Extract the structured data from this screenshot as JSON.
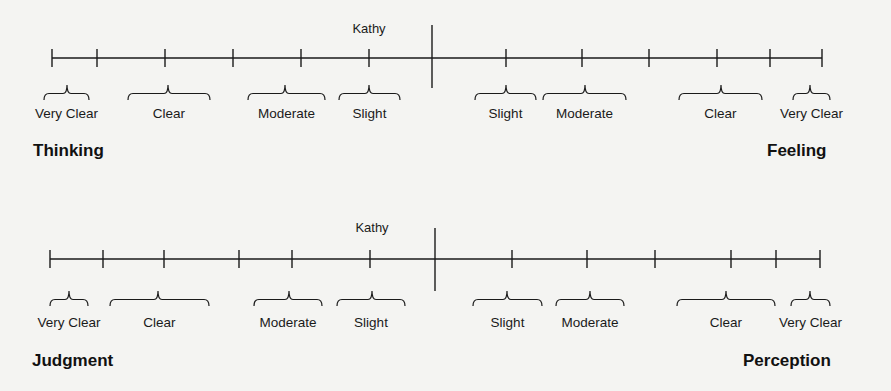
{
  "scales": [
    {
      "id": "thinking-feeling",
      "left_pole": "Thinking",
      "right_pole": "Feeling",
      "marker_label": "Kathy",
      "line_y": 58,
      "x_start": 52,
      "x_end": 822,
      "center_x": 432,
      "center_top": 25,
      "center_bottom": 88,
      "marker_x": 369,
      "marker_y": 33,
      "ticks": [
        52,
        97,
        165,
        233,
        301,
        369,
        506,
        582,
        649,
        717,
        770,
        822
      ],
      "brace_top": 85,
      "brace_bottom": 100,
      "label_y": 118,
      "pole_y": 156,
      "left_pole_x": 33,
      "right_pole_x": 767,
      "categories": [
        {
          "label": "Very Clear",
          "x1": 44,
          "x2": 89,
          "peak": 67
        },
        {
          "label": "Clear",
          "x1": 128,
          "x2": 210,
          "peak": 168
        },
        {
          "label": "Moderate",
          "x1": 248,
          "x2": 325,
          "peak": 285
        },
        {
          "label": "Slight",
          "x1": 339,
          "x2": 400,
          "peak": 369
        },
        {
          "label": "Slight",
          "x1": 475,
          "x2": 536,
          "peak": 506
        },
        {
          "label": "Moderate",
          "x1": 543,
          "x2": 626,
          "peak": 585
        },
        {
          "label": "Clear",
          "x1": 679,
          "x2": 762,
          "peak": 721
        },
        {
          "label": "Very Clear",
          "x1": 793,
          "x2": 830,
          "peak": 810
        }
      ]
    },
    {
      "id": "judgment-perception",
      "left_pole": "Judgment",
      "right_pole": "Perception",
      "marker_label": "Kathy",
      "line_y": 259,
      "x_start": 50,
      "x_end": 820,
      "center_x": 435,
      "center_top": 228,
      "center_bottom": 291,
      "marker_x": 372,
      "marker_y": 232,
      "ticks": [
        50,
        103,
        164,
        239,
        292,
        370,
        512,
        587,
        655,
        731,
        776,
        820
      ],
      "brace_top": 291,
      "brace_bottom": 306,
      "label_y": 327,
      "pole_y": 366,
      "left_pole_x": 32,
      "right_pole_x": 743,
      "categories": [
        {
          "label": "Very Clear",
          "x1": 50,
          "x2": 88,
          "peak": 69
        },
        {
          "label": "Clear",
          "x1": 110,
          "x2": 209,
          "peak": 158
        },
        {
          "label": "Moderate",
          "x1": 254,
          "x2": 322,
          "peak": 289
        },
        {
          "label": "Slight",
          "x1": 337,
          "x2": 405,
          "peak": 372
        },
        {
          "label": "Slight",
          "x1": 473,
          "x2": 542,
          "peak": 507
        },
        {
          "label": "Moderate",
          "x1": 556,
          "x2": 624,
          "peak": 590
        },
        {
          "label": "Clear",
          "x1": 677,
          "x2": 775,
          "peak": 726
        },
        {
          "label": "Very Clear",
          "x1": 791,
          "x2": 830,
          "peak": 810
        }
      ]
    }
  ]
}
